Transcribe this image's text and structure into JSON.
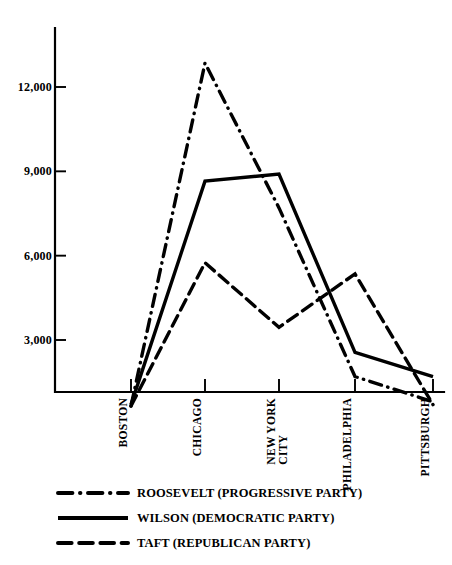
{
  "chart_data": {
    "type": "line",
    "title": "",
    "subtitle": "",
    "xlabel": "",
    "ylabel": "",
    "grid": false,
    "legend_position": "bottom-left",
    "categories": [
      "BOSTON",
      "CHICAGO",
      "NEW YORK\nCITY",
      "PHILADELPHIA",
      "PITTSBURGH"
    ],
    "category_labels_flat": [
      "BOSTON",
      "CHICAGO",
      "NEW YORK CITY",
      "PHILADELPHIA",
      "PITTSBURGH"
    ],
    "ylim": [
      0,
      13900
    ],
    "yticks": [
      3000,
      6000,
      9000,
      12000
    ],
    "ytick_labels": [
      "3,000",
      "6,000",
      "9,000",
      "12,000"
    ],
    "series": [
      {
        "name": "ROOSEVELT (PROGRESSIVE PARTY)",
        "style": "dash-dot",
        "color": "#000000",
        "values": [
          650,
          12850,
          7700,
          1700,
          800
        ]
      },
      {
        "name": "WILSON (DEMOCRATIC PARTY)",
        "style": "solid",
        "color": "#000000",
        "values": [
          700,
          8650,
          8900,
          2560,
          1700
        ]
      },
      {
        "name": "TAFT (REPUBLICAN PARTY)",
        "style": "long-dash",
        "color": "#000000",
        "values": [
          650,
          5750,
          3450,
          5350,
          700
        ]
      }
    ]
  },
  "legend": {
    "items": [
      {
        "label": "ROOSEVELT (PROGRESSIVE PARTY)",
        "style": "dash-dot"
      },
      {
        "label": "WILSON (DEMOCRATIC PARTY)",
        "style": "solid"
      },
      {
        "label": "TAFT (REPUBLICAN PARTY)",
        "style": "long-dash"
      }
    ]
  }
}
